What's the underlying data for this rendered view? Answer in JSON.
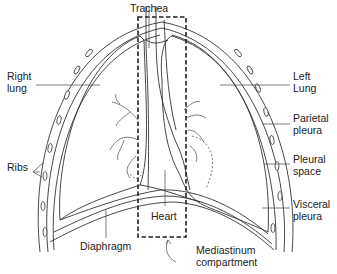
{
  "diagram": {
    "type": "anatomical-illustration",
    "labels": {
      "trachea": "Trachea",
      "right_lung": "Right\nlung",
      "left_lung": "Left\nLung",
      "parietal_pleura": "Parietal\npleura",
      "ribs": "Ribs",
      "pleural_space": "Pleural\nspace",
      "heart": "Heart",
      "visceral_pleura": "Visceral\npleura",
      "diaphragm": "Diaphragm",
      "mediastinum": "Mediastinum\ncompartment"
    },
    "colors": {
      "line": "#333333",
      "background": "#ffffff"
    }
  }
}
